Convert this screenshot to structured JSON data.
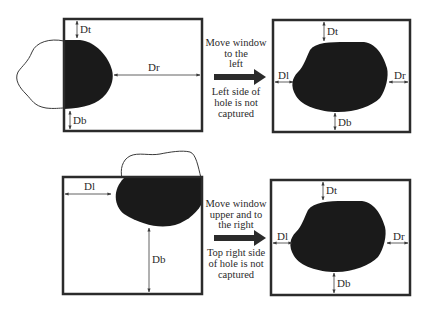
{
  "panels": {
    "top": {
      "before": {
        "labels": {
          "dt": "Dt",
          "db": "Db",
          "dr": "Dr"
        }
      },
      "caption": {
        "action": [
          "Move window",
          "to the",
          "left"
        ],
        "result": [
          "Left side of",
          "hole is not",
          "captured"
        ]
      },
      "after": {
        "labels": {
          "dt": "Dt",
          "db": "Db",
          "dl": "Dl",
          "dr": "Dr"
        }
      }
    },
    "bottom": {
      "before": {
        "labels": {
          "dl": "Dl",
          "db": "Db"
        }
      },
      "caption": {
        "action": [
          "Move window",
          "upper and to",
          "the right"
        ],
        "result": [
          "Top right side",
          "of hole is not",
          "captured"
        ]
      },
      "after": {
        "labels": {
          "dt": "Dt",
          "db": "Db",
          "dl": "Dl",
          "dr": "Dr"
        }
      }
    }
  },
  "colors": {
    "frame": "#2b2b2b",
    "hole_fill": "#1a1a1a",
    "outline": "#3a3a3a",
    "text": "#2a2a2a",
    "background": "#ffffff"
  }
}
